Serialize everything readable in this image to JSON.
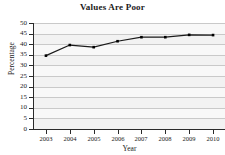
{
  "chart_data": {
    "type": "line",
    "title": "Values Are Poor",
    "xlabel": "Year",
    "ylabel": "Percentage",
    "categories": [
      "2003",
      "2004",
      "2005",
      "2006",
      "2007",
      "2008",
      "2009",
      "2010"
    ],
    "x": [
      2003,
      2004,
      2005,
      2006,
      2007,
      2008,
      2009,
      2010
    ],
    "values": [
      34.6,
      39.6,
      38.6,
      41.4,
      43.3,
      43.3,
      44.4,
      44.3
    ],
    "series": [
      {
        "name": "Percentage",
        "values": [
          34.6,
          39.6,
          38.6,
          41.4,
          43.3,
          43.3,
          44.4,
          44.3
        ]
      }
    ],
    "ylim": [
      0,
      50
    ],
    "ytick_step": 5,
    "yticks": [
      0,
      5,
      10,
      15,
      20,
      25,
      30,
      35,
      40,
      45,
      50
    ],
    "ytick_labels": [
      "0",
      "5",
      "10",
      "15",
      "20",
      "25",
      "30",
      "35",
      "40",
      "45",
      "50"
    ],
    "xlim": [
      2002.5,
      2010.5
    ],
    "grid": "horizontal",
    "legend": "none",
    "marker": "square",
    "line_color": "#1a1a1a",
    "marker_color": "#000000",
    "plot_background": "#f0f0f0",
    "gridline_color": "#c9c9c9"
  }
}
